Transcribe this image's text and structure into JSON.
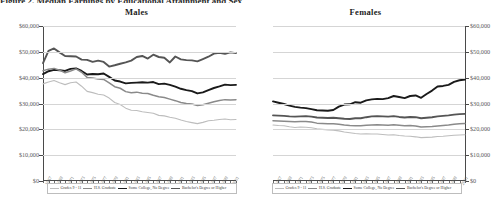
{
  "figure": {
    "cut_off_header": "Figure 2. Median Earnings by Educational Attainment and Sex",
    "panels": [
      "Males",
      "Females"
    ]
  },
  "axis": {
    "y_ticks": [
      "$60,000",
      "$50,000",
      "$40,000",
      "$30,000",
      "$20,000",
      "$10,000",
      "$0"
    ],
    "y_values": [
      60000,
      50000,
      40000,
      30000,
      20000,
      10000,
      0
    ],
    "ylim": [
      0,
      60000
    ],
    "x_ticks": [
      "1967",
      "1968",
      "1969",
      "1970",
      "1971",
      "1972",
      "1973",
      "1974",
      "1975",
      "1976",
      "1977",
      "1978",
      "1979",
      "1980",
      "1981",
      "1982",
      "1983",
      "1984",
      "1985",
      "1986",
      "1987",
      "1988",
      "1989",
      "1990",
      "1991",
      "1992",
      "1993",
      "1994",
      "1995",
      "1996",
      "1997",
      "1998",
      "1999",
      "2000",
      "2001",
      "2002"
    ],
    "x_labels_shown": [
      "1967",
      "1969",
      "1971",
      "1973",
      "1975",
      "1977",
      "1979",
      "1981",
      "1983",
      "1985",
      "1987",
      "1989",
      "1991",
      "1993",
      "1995",
      "1997",
      "1999",
      "2001"
    ]
  },
  "legend": {
    "items": [
      {
        "label": "Grades 9 - 11",
        "color": "#bdbdbd",
        "width": 1.1
      },
      {
        "label": "H.S. Graduate",
        "color": "#8a8a8a",
        "width": 1.6
      },
      {
        "label": "Some College, No Degree",
        "color": "#1a1a1a",
        "width": 1.9
      },
      {
        "label": "Bachelor's Degree or Higher",
        "color": "#555555",
        "width": 1.9
      }
    ]
  },
  "chart_data": {
    "type": "line",
    "title": "Median Earnings by Educational Attainment and Sex",
    "xlabel": "",
    "ylabel": "Median Earnings",
    "ylim": [
      0,
      60000
    ],
    "grid": true,
    "legend_position": "bottom",
    "x": [
      1967,
      1968,
      1969,
      1970,
      1971,
      1972,
      1973,
      1974,
      1975,
      1976,
      1977,
      1978,
      1979,
      1980,
      1981,
      1982,
      1983,
      1984,
      1985,
      1986,
      1987,
      1988,
      1989,
      1990,
      1991,
      1992,
      1993,
      1994,
      1995,
      1996,
      1997,
      1998,
      1999,
      2000,
      2001,
      2002
    ],
    "panels": [
      {
        "name": "Males",
        "series": [
          {
            "name": "Bachelor's Degree or Higher",
            "color": "#555555",
            "values": [
              45600,
              50400,
              51300,
              49800,
              48400,
              48300,
              48200,
              47000,
              46900,
              46100,
              46600,
              46100,
              44300,
              44800,
              45400,
              45900,
              46600,
              48000,
              48400,
              47400,
              48900,
              48000,
              47700,
              45900,
              48200,
              47100,
              46800,
              46700,
              46300,
              47200,
              48100,
              49300,
              49600,
              49200,
              49800,
              49500
            ]
          },
          {
            "name": "Some College, No Degree",
            "color": "#1a1a1a",
            "values": [
              41400,
              42500,
              43000,
              42900,
              42600,
              43400,
              43600,
              42600,
              41200,
              41400,
              41300,
              41600,
              40300,
              38900,
              38500,
              37800,
              38000,
              38100,
              38200,
              38100,
              38300,
              37500,
              37700,
              37200,
              36500,
              35700,
              35200,
              34800,
              33900,
              34300,
              35200,
              36000,
              36600,
              37300,
              37100,
              37200
            ]
          },
          {
            "name": "H.S. Graduate",
            "color": "#8a8a8a",
            "values": [
              42700,
              43300,
              43600,
              42900,
              41900,
              42600,
              43400,
              42100,
              40100,
              39900,
              39500,
              39300,
              38000,
              36500,
              35900,
              34600,
              34200,
              34400,
              34000,
              33900,
              33200,
              32600,
              32300,
              31700,
              31100,
              30400,
              30000,
              29800,
              29200,
              29500,
              30100,
              30700,
              31200,
              31500,
              31400,
              31500
            ]
          },
          {
            "name": "Grades 9 - 11",
            "color": "#bdbdbd",
            "values": [
              37600,
              38300,
              38900,
              38000,
              37300,
              38000,
              38300,
              36700,
              34700,
              34200,
              33600,
              33300,
              32100,
              30400,
              29600,
              28200,
              27400,
              27300,
              26800,
              26500,
              26200,
              25400,
              25200,
              24700,
              24300,
              23600,
              23000,
              22600,
              22200,
              22700,
              23300,
              23500,
              23800,
              24000,
              23700,
              23800
            ]
          }
        ]
      },
      {
        "name": "Females",
        "series": [
          {
            "name": "Bachelor's Degree or Higher",
            "color": "#1a1a1a",
            "values": [
              30800,
              30300,
              29800,
              29200,
              28700,
              28400,
              28200,
              27800,
              27400,
              27300,
              27200,
              27500,
              28800,
              29600,
              29700,
              30500,
              30300,
              31200,
              31600,
              31800,
              31700,
              32100,
              32900,
              32500,
              32100,
              32900,
              33100,
              32200,
              33700,
              35000,
              36600,
              36800,
              37200,
              38400,
              39000,
              39300
            ]
          },
          {
            "name": "Some College, No Degree",
            "color": "#555555",
            "values": [
              25400,
              25300,
              25200,
              25000,
              24900,
              25000,
              25100,
              24900,
              24600,
              24500,
              24400,
              24500,
              24300,
              24100,
              24000,
              24300,
              24300,
              24700,
              25000,
              25100,
              25000,
              24900,
              25100,
              24800,
              24600,
              24800,
              24700,
              24300,
              24500,
              24700,
              25000,
              25200,
              25400,
              25700,
              25900,
              26000
            ]
          },
          {
            "name": "H.S. Graduate",
            "color": "#8a8a8a",
            "values": [
              23300,
              23200,
              23100,
              23000,
              22900,
              23000,
              23000,
              22800,
              22400,
              22300,
              22200,
              22200,
              22000,
              21700,
              21500,
              21400,
              21400,
              21600,
              21700,
              21800,
              21700,
              21600,
              21800,
              21600,
              21400,
              21500,
              21300,
              20900,
              21000,
              21100,
              21300,
              21500,
              21700,
              22000,
              22200,
              22300
            ]
          },
          {
            "name": "Grades 9 - 11",
            "color": "#bdbdbd",
            "values": [
              21700,
              21500,
              21400,
              21000,
              20700,
              20900,
              20800,
              20600,
              20200,
              20000,
              19800,
              19700,
              19400,
              19000,
              18700,
              18400,
              18200,
              18300,
              18200,
              18200,
              18000,
              17800,
              17900,
              17600,
              17400,
              17300,
              17100,
              16800,
              16900,
              17000,
              17200,
              17300,
              17500,
              17700,
              17800,
              17900
            ]
          }
        ]
      }
    ]
  }
}
